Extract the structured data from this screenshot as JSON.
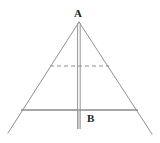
{
  "figure": {
    "type": "geometry-diagram",
    "canvas": {
      "width": 160,
      "height": 143,
      "background": "#ffffff"
    },
    "colors": {
      "stroke": "#909090",
      "stroke_dark": "#7a7a7a",
      "label": "#1d1d1d"
    },
    "labels": [
      {
        "id": "apex",
        "text": "A",
        "x": 74,
        "y": 8
      },
      {
        "id": "base",
        "text": "B",
        "x": 87,
        "y": 113
      }
    ],
    "points": {
      "A": {
        "x": 79,
        "y": 22
      },
      "B": {
        "x": 79,
        "y": 129
      },
      "left_base": {
        "x": 21,
        "y": 110
      },
      "right_base": {
        "x": 138,
        "y": 110
      },
      "left_foot": {
        "x": 8,
        "y": 133
      },
      "right_foot": {
        "x": 152,
        "y": 134
      },
      "dash_left": {
        "x": 50,
        "y": 66
      },
      "dash_right": {
        "x": 109,
        "y": 66
      }
    },
    "segments": [
      {
        "id": "left-slant",
        "style": "solid",
        "from": "A",
        "to": "left_foot",
        "width": 1
      },
      {
        "id": "right-slant",
        "style": "solid",
        "from": "A",
        "to": "right_foot",
        "width": 1
      },
      {
        "id": "horizontal-base",
        "style": "solid",
        "from": "left_base",
        "to": "right_base",
        "width": 1.4
      },
      {
        "id": "vertical-axis",
        "style": "double",
        "from": "A",
        "to": "B",
        "width": 1
      },
      {
        "id": "dashed-chord",
        "style": "dashed",
        "from": "dash_left",
        "to": "dash_right",
        "width": 1,
        "dasharray": "4 3"
      }
    ]
  }
}
